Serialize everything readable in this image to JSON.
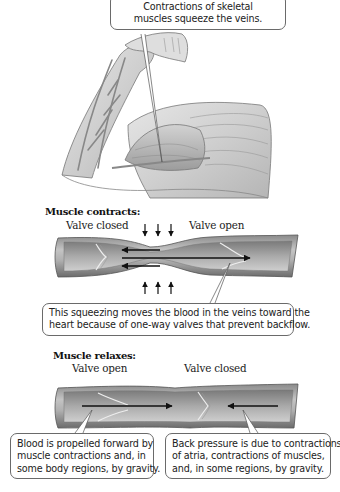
{
  "top_callout": {
    "lines": [
      "Contractions of skeletal",
      "muscles squeeze the veins."
    ]
  },
  "contract_section": {
    "heading": "Muscle contracts:",
    "valve_left_label": "Valve closed",
    "valve_right_label": "Valve open",
    "callout_lines": [
      "This squeezing moves the blood in the veins toward the",
      "heart because of one-way valves that prevent backflow."
    ]
  },
  "relax_section": {
    "heading": "Muscle relaxes:",
    "valve_left_label": "Valve open",
    "valve_right_label": "Valve closed",
    "left_callout_lines": [
      "Blood is propelled forward by",
      "muscle contractions and, in",
      "some body regions, by gravity."
    ],
    "right_callout_lines": [
      "Back pressure is due to contractions",
      "of atria, contractions of muscles,",
      "and, in some regions, by gravity."
    ]
  },
  "colors": {
    "vein_dark": "#6e6e6e",
    "vein_mid": "#a8a8a8",
    "vein_light": "#dcdcdc",
    "arrow": "#111111",
    "callout_border": "#6a6a6a"
  }
}
